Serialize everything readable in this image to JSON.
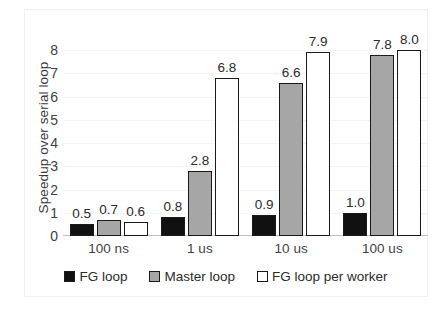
{
  "chart_data": {
    "type": "bar",
    "title": "",
    "subtitle": "",
    "xlabel": "",
    "ylabel": "Speedup over serial loop",
    "categories": [
      "100 ns",
      "1 us",
      "10 us",
      "100 us"
    ],
    "series": [
      {
        "name": "FG loop",
        "values": [
          0.5,
          0.8,
          0.9,
          1.0
        ],
        "color": "#111111"
      },
      {
        "name": "Master loop",
        "values": [
          0.7,
          2.8,
          6.6,
          7.8
        ],
        "color": "#a6a6a6"
      },
      {
        "name": "FG loop per worker",
        "values": [
          0.6,
          6.8,
          7.9,
          8.0
        ],
        "color": "#ffffff"
      }
    ],
    "data_labels": [
      [
        "0.5",
        "0.7",
        "0.6"
      ],
      [
        "0.8",
        "2.8",
        "6.8"
      ],
      [
        "0.9",
        "6.6",
        "7.9"
      ],
      [
        "1.0",
        "7.8",
        "8.0"
      ]
    ],
    "ylim": [
      0,
      8
    ],
    "yticks": [
      0,
      1,
      2,
      3,
      4,
      5,
      6,
      7,
      8
    ],
    "ytick_labels": [
      "0",
      "1",
      "2",
      "3",
      "4",
      "5",
      "6",
      "7",
      "8"
    ],
    "grid": true,
    "grid_axis": "y",
    "legend_position": "bottom",
    "bar_border_color": "#1a1a1a",
    "background": "#ffffff"
  }
}
